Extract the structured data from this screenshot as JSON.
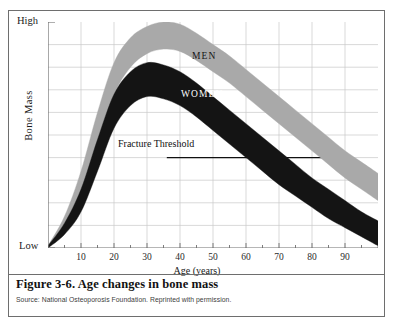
{
  "figure": {
    "caption": "Figure 3-6. Age changes in bone mass",
    "source": "Source: National Osteoporosis Foundation. Reprinted with permission."
  },
  "chart_data": {
    "type": "area",
    "title": "Figure 3-6. Age changes in bone mass",
    "subtitle": "",
    "xlabel": "Age (years)",
    "ylabel": "Bone Mass",
    "xlim": [
      0,
      100
    ],
    "ylim": [
      0,
      100
    ],
    "ytick_labels": [
      "Low",
      "High"
    ],
    "ytick_values": [
      0,
      100
    ],
    "xtick_labels": [
      "10",
      "20",
      "30",
      "40",
      "50",
      "60",
      "70",
      "80",
      "90"
    ],
    "xtick_values": [
      10,
      20,
      30,
      40,
      50,
      60,
      70,
      80,
      90
    ],
    "minor_xtick_step": 5,
    "grid": true,
    "grid_color": "#c9c9c9",
    "axis_color": "#6e6e6e",
    "legend_position": "inline-band-labels",
    "annotations": [
      {
        "name": "fracture-threshold",
        "text": "Fracture Threshold",
        "y_value": 40,
        "leader_line": true,
        "leader_from_x": 36,
        "leader_to_x": 85
      }
    ],
    "series": [
      {
        "name": "MEN",
        "label": "MEN",
        "color": "#a9a9a9",
        "x": [
          0,
          5,
          10,
          15,
          20,
          25,
          30,
          35,
          40,
          45,
          50,
          55,
          60,
          65,
          70,
          75,
          80,
          85,
          90,
          95,
          100
        ],
        "upper": [
          1,
          14,
          34,
          60,
          82,
          93,
          98,
          100,
          99,
          95,
          90,
          85,
          79,
          73,
          67,
          61,
          55,
          49,
          43,
          38,
          33
        ],
        "lower": [
          0,
          9,
          24,
          46,
          68,
          80,
          86,
          88,
          87,
          83,
          78,
          73,
          67,
          61,
          55,
          49,
          43,
          37,
          31,
          26,
          21
        ]
      },
      {
        "name": "WOMEN",
        "label": "WOMEN",
        "color": "#141414",
        "x": [
          0,
          5,
          10,
          15,
          20,
          25,
          30,
          35,
          40,
          45,
          50,
          55,
          60,
          65,
          70,
          75,
          80,
          85,
          90,
          95,
          100
        ],
        "upper": [
          1,
          11,
          26,
          48,
          68,
          78,
          82,
          81,
          78,
          73,
          67,
          61,
          55,
          49,
          43,
          37,
          31,
          26,
          21,
          16,
          12
        ],
        "lower": [
          0,
          6,
          16,
          34,
          53,
          63,
          67,
          66,
          63,
          58,
          52,
          46,
          40,
          34,
          28,
          23,
          18,
          13,
          9,
          5,
          1
        ]
      }
    ]
  },
  "axes": {
    "y_high_label": "High",
    "y_low_label": "Low",
    "y_title": "Bone Mass",
    "x_title": "Age (years)"
  },
  "labels": {
    "men": "MEN",
    "women": "WOMEN",
    "fracture_threshold": "Fracture Threshold"
  }
}
